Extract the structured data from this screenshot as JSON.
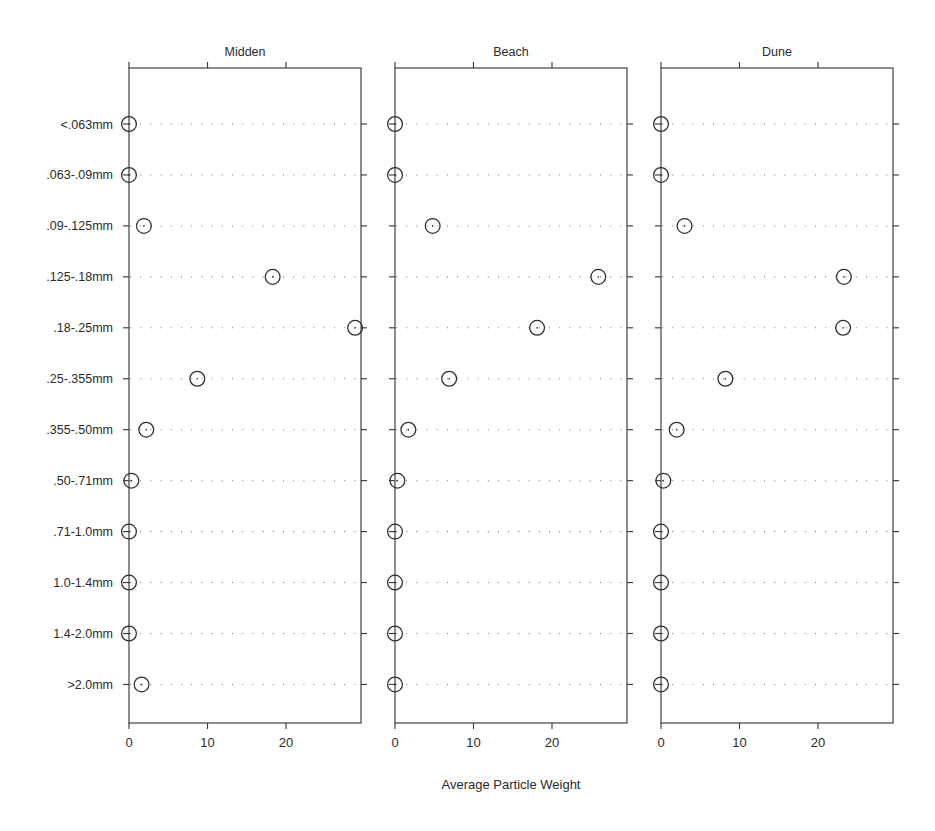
{
  "figure": {
    "xlabel": "Average Particle Weight",
    "panel_titles": [
      "Midden",
      "Beach",
      "Dune"
    ],
    "xticks": [
      "0",
      "10",
      "20"
    ],
    "categories": [
      "<.063mm",
      ".063-.09mm",
      ".09-.125mm",
      ".125-.18mm",
      ".18-.25mm",
      ".25-.355mm",
      ".355-.50mm",
      ".50-.71mm",
      ".71-1.0mm",
      "1.0-1.4mm",
      "1.4-2.0mm",
      ">2.0mm"
    ]
  },
  "chart_data": {
    "type": "scatter",
    "title": "",
    "subtitle": "",
    "xlabel": "Average Particle Weight",
    "ylabel": "",
    "xlim": [
      -1.4,
      29.5
    ],
    "xticks": [
      0,
      10,
      20
    ],
    "grid": "dotted horizontal rows",
    "legend": "none",
    "layout": "three horizontal panels sharing y-axis categories and x-axis scale",
    "marker": "open circle",
    "categories": [
      "<.063mm",
      ".063-.09mm",
      ".09-.125mm",
      ".125-.18mm",
      ".18-.25mm",
      ".25-.355mm",
      ".355-.50mm",
      ".50-.71mm",
      ".71-1.0mm",
      "1.0-1.4mm",
      "1.4-2.0mm",
      ">2.0mm"
    ],
    "panels": [
      {
        "name": "Midden",
        "values": [
          0.0,
          0.0,
          1.9,
          18.3,
          28.8,
          8.7,
          2.2,
          0.3,
          0.0,
          0.0,
          0.0,
          1.6
        ]
      },
      {
        "name": "Beach",
        "values": [
          0.0,
          0.0,
          4.8,
          25.9,
          18.1,
          6.9,
          1.7,
          0.3,
          0.0,
          0.0,
          0.0,
          0.0
        ]
      },
      {
        "name": "Dune",
        "values": [
          0.0,
          0.0,
          3.0,
          23.3,
          23.2,
          8.2,
          2.0,
          0.3,
          0.0,
          0.0,
          0.0,
          0.0
        ]
      }
    ]
  },
  "colors": {
    "axis": "#3a3a3a",
    "marker": "#2e2e2e",
    "grid": "#777777",
    "text": "#2b2b2b",
    "background": "#ffffff"
  }
}
